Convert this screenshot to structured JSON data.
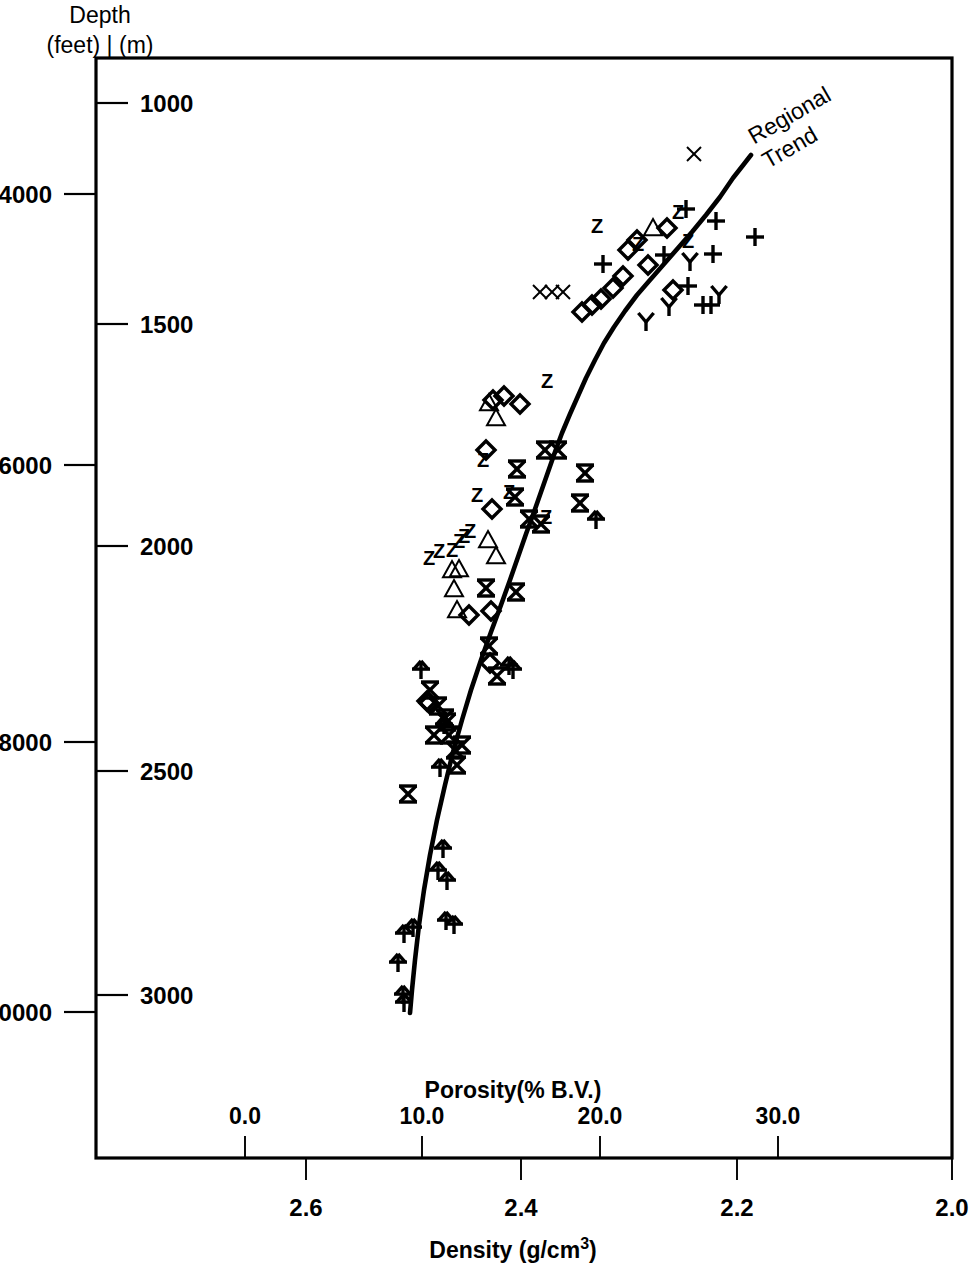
{
  "figure": {
    "header_line1": "Depth",
    "header_line2": "(feet)  |  (m)",
    "annotation_line1": "Regional",
    "annotation_line2": "Trend",
    "ink_color": "#000000",
    "background_color": "#ffffff"
  },
  "chart_data": {
    "type": "scatter",
    "title": "",
    "subtitle": "",
    "xlabel": "Density (g/cm3)",
    "xlabel_display": "Density (g/cm³)",
    "xlabel_top": "Porosity(% B.V.)",
    "ylabel": "Depth (feet) | (m)",
    "grid": false,
    "legend": false,
    "legend_position": "none",
    "axes": {
      "x_primary": {
        "name": "Density (g/cm3)",
        "position": "bottom-outer",
        "tick_labels": [
          "2.6",
          "2.4",
          "2.2",
          "2.0"
        ],
        "tick_values": [
          2.6,
          2.4,
          2.2,
          2.0
        ],
        "direction": "decreasing-right",
        "xlim": [
          2.7,
          2.0
        ]
      },
      "x_secondary": {
        "name": "Porosity(% B.V.)",
        "position": "bottom-inner",
        "tick_labels": [
          "0.0",
          "10.0",
          "20.0",
          "30.0"
        ],
        "tick_values": [
          0.0,
          10.0,
          20.0,
          30.0
        ],
        "direction": "increasing-right",
        "xlim": [
          -3.5,
          40.0
        ]
      },
      "y_primary": {
        "name": "Depth (feet)",
        "position": "left-outer",
        "tick_labels": [
          "4000",
          "6000",
          "8000",
          "10000"
        ],
        "tick_values": [
          4000,
          6000,
          8000,
          10000
        ],
        "direction": "increasing-down",
        "ylim": [
          2700,
          10650
        ]
      },
      "y_secondary": {
        "name": "Depth (m)",
        "position": "left-inner",
        "tick_labels": [
          "1000",
          "1500",
          "2000",
          "2500",
          "3000"
        ],
        "tick_values": [
          1000,
          1500,
          2000,
          2500,
          3000
        ],
        "direction": "increasing-down",
        "ylim": [
          820,
          3245
        ]
      }
    },
    "annotations": [
      {
        "text": "Regional Trend",
        "rotation_deg": -30,
        "target": "trend-line-upper-end"
      }
    ],
    "trend_line": {
      "name": "Regional Trend",
      "style": "solid",
      "points_px": [
        [
          410,
          1013
        ],
        [
          412,
          990
        ],
        [
          415,
          960
        ],
        [
          419,
          925
        ],
        [
          424,
          890
        ],
        [
          430,
          855
        ],
        [
          437,
          820
        ],
        [
          445,
          785
        ],
        [
          453,
          752
        ],
        [
          462,
          720
        ],
        [
          471,
          690
        ],
        [
          481,
          660
        ],
        [
          491,
          632
        ],
        [
          501,
          605
        ],
        [
          510,
          580
        ],
        [
          518,
          557
        ],
        [
          526,
          534
        ],
        [
          534,
          512
        ],
        [
          541,
          492
        ],
        [
          548,
          472
        ],
        [
          555,
          452
        ],
        [
          562,
          433
        ],
        [
          570,
          414
        ],
        [
          578,
          396
        ],
        [
          586,
          378
        ],
        [
          595,
          360
        ],
        [
          604,
          343
        ],
        [
          614,
          327
        ],
        [
          625,
          311
        ],
        [
          637,
          295
        ],
        [
          650,
          280
        ],
        [
          664,
          264
        ],
        [
          678,
          248
        ],
        [
          692,
          232
        ],
        [
          706,
          215
        ],
        [
          720,
          197
        ],
        [
          733,
          178
        ],
        [
          744,
          164
        ],
        [
          751,
          155
        ]
      ]
    },
    "marker_kinds": [
      "x-thin",
      "x-bold",
      "z",
      "plus",
      "diamond",
      "triangle",
      "y",
      "arrow-up"
    ],
    "series": [
      {
        "name": "x-thin",
        "glyph": "x",
        "points_px": [
          [
            694,
            154
          ],
          [
            540,
            292
          ],
          [
            552,
            292
          ],
          [
            563,
            292
          ]
        ]
      },
      {
        "name": "x-bold",
        "glyph": "X",
        "points_px": [
          [
            517,
            469
          ],
          [
            545,
            450
          ],
          [
            558,
            450
          ],
          [
            515,
            497
          ],
          [
            529,
            519
          ],
          [
            585,
            473
          ],
          [
            580,
            503
          ],
          [
            541,
            524
          ],
          [
            486,
            588
          ],
          [
            516,
            592
          ],
          [
            489,
            646
          ],
          [
            497,
            676
          ],
          [
            430,
            690
          ],
          [
            438,
            706
          ],
          [
            445,
            718
          ],
          [
            434,
            735
          ],
          [
            449,
            735
          ],
          [
            455,
            750
          ],
          [
            462,
            745
          ],
          [
            457,
            765
          ],
          [
            408,
            794
          ],
          [
            447,
            722
          ]
        ]
      },
      {
        "name": "z",
        "glyph": "Z",
        "points_px": [
          [
            597,
            228
          ],
          [
            638,
            246
          ],
          [
            678,
            214
          ],
          [
            688,
            243
          ],
          [
            547,
            383
          ],
          [
            483,
            462
          ],
          [
            477,
            497
          ],
          [
            509,
            494
          ],
          [
            464,
            538
          ],
          [
            470,
            533
          ],
          [
            546,
            519
          ],
          [
            459,
            543
          ],
          [
            452,
            552
          ],
          [
            429,
            560
          ],
          [
            439,
            553
          ]
        ]
      },
      {
        "name": "plus",
        "glyph": "+",
        "points_px": [
          [
            686,
            209
          ],
          [
            716,
            221
          ],
          [
            755,
            237
          ],
          [
            664,
            255
          ],
          [
            688,
            286
          ],
          [
            703,
            305
          ],
          [
            711,
            305
          ],
          [
            603,
            264
          ],
          [
            713,
            254
          ]
        ]
      },
      {
        "name": "diamond",
        "glyph": "diamond",
        "points_px": [
          [
            637,
            240
          ],
          [
            667,
            228
          ],
          [
            628,
            250
          ],
          [
            623,
            276
          ],
          [
            613,
            288
          ],
          [
            601,
            299
          ],
          [
            592,
            305
          ],
          [
            582,
            312
          ],
          [
            673,
            290
          ],
          [
            648,
            265
          ],
          [
            493,
            400
          ],
          [
            504,
            396
          ],
          [
            520,
            404
          ],
          [
            486,
            450
          ],
          [
            492,
            509
          ],
          [
            469,
            615
          ],
          [
            427,
            701
          ],
          [
            490,
            663
          ],
          [
            491,
            611
          ],
          [
            429,
            703
          ]
        ]
      },
      {
        "name": "triangle",
        "glyph": "triangle",
        "points_px": [
          [
            653,
            228
          ],
          [
            496,
            418
          ],
          [
            489,
            403
          ],
          [
            488,
            540
          ],
          [
            496,
            556
          ],
          [
            452,
            570
          ],
          [
            459,
            569
          ],
          [
            454,
            589
          ],
          [
            457,
            610
          ]
        ]
      },
      {
        "name": "y",
        "glyph": "Y",
        "points_px": [
          [
            669,
            307
          ],
          [
            646,
            322
          ],
          [
            719,
            295
          ],
          [
            690,
            262
          ]
        ]
      },
      {
        "name": "arrow-up",
        "glyph": "arrow-up",
        "points_px": [
          [
            596,
            520
          ],
          [
            513,
            670
          ],
          [
            509,
            666
          ],
          [
            444,
            725
          ],
          [
            440,
            768
          ],
          [
            443,
            849
          ],
          [
            438,
            871
          ],
          [
            447,
            881
          ],
          [
            446,
            921
          ],
          [
            454,
            925
          ],
          [
            404,
            934
          ],
          [
            413,
            928
          ],
          [
            398,
            963
          ],
          [
            403,
            995
          ],
          [
            404,
            1003
          ],
          [
            421,
            670
          ]
        ]
      }
    ],
    "marker_counts": {
      "x-thin": 4,
      "x-bold": 22,
      "z": 15,
      "plus": 9,
      "diamond": 20,
      "triangle": 9,
      "y": 4,
      "arrow-up": 16
    },
    "plot_box_px": {
      "left": 96,
      "top": 58,
      "right": 952,
      "bottom": 1158
    }
  },
  "ticks": {
    "feet": [
      {
        "label": "4000",
        "y": 194
      },
      {
        "label": "6000",
        "y": 465
      },
      {
        "label": "8000",
        "y": 742
      },
      {
        "label": "10000",
        "y": 1012
      }
    ],
    "meters": [
      {
        "label": "1000",
        "y": 103
      },
      {
        "label": "1500",
        "y": 324
      },
      {
        "label": "2000",
        "y": 546
      },
      {
        "label": "2500",
        "y": 771
      },
      {
        "label": "3000",
        "y": 995
      }
    ],
    "porosity": [
      {
        "label": "0.0",
        "x": 245
      },
      {
        "label": "10.0",
        "x": 422
      },
      {
        "label": "20.0",
        "x": 600
      },
      {
        "label": "30.0",
        "x": 778
      }
    ],
    "density": [
      {
        "label": "2.6",
        "x": 306
      },
      {
        "label": "2.4",
        "x": 521
      },
      {
        "label": "2.2",
        "x": 737
      },
      {
        "label": "2.0",
        "x": 952
      }
    ]
  },
  "axis_titles": {
    "porosity": "Porosity(% B.V.)",
    "density_pre": "Density (g/cm",
    "density_sup": "3",
    "density_post": ")"
  }
}
